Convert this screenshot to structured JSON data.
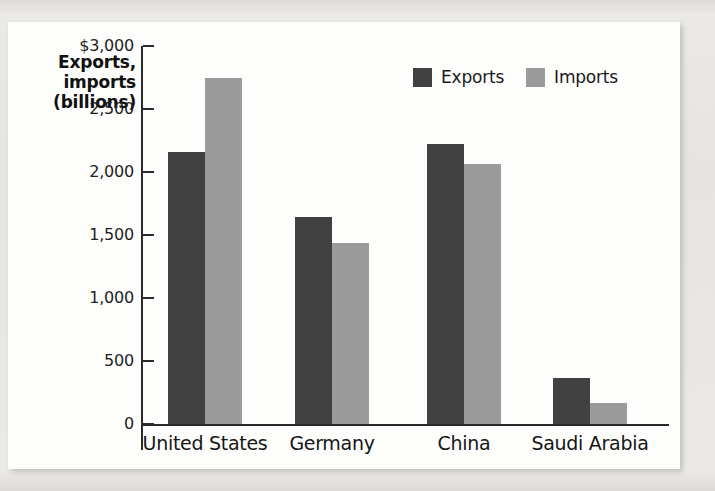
{
  "chart_data": {
    "type": "bar",
    "title": "",
    "xlabel": "",
    "ylabel": "Exports, imports (billions)",
    "ylabel_lines": [
      "Exports,",
      "imports",
      "(billions)"
    ],
    "categories": [
      "United States",
      "Germany",
      "China",
      "Saudi Arabia"
    ],
    "series": [
      {
        "name": "Exports",
        "color": "#414141",
        "values": [
          2160,
          1640,
          2220,
          365
        ]
      },
      {
        "name": "Imports",
        "color": "#9b9b9b",
        "values": [
          2745,
          1435,
          2065,
          165
        ]
      }
    ],
    "ylim": [
      0,
      3000
    ],
    "y_ticks": [
      0,
      500,
      1000,
      1500,
      2000,
      2500,
      3000
    ],
    "y_tick_labels": [
      "0",
      "500",
      "1,000",
      "1,500",
      "2,000",
      "2,500",
      "$3,000"
    ],
    "grid": false,
    "legend_position": "top-right",
    "legend_entries": [
      "Exports",
      "Imports"
    ]
  },
  "colors": {
    "exports": "#414141",
    "imports": "#9b9b9b",
    "axis": "#2b2b2b",
    "panel": "#fdfdfc",
    "page": "#e9e8e6"
  }
}
